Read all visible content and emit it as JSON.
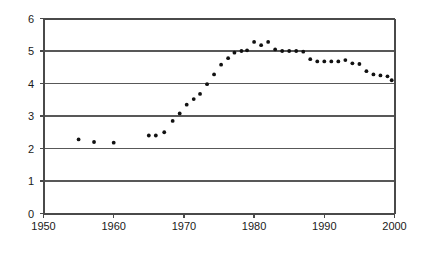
{
  "chart_data": {
    "type": "scatter",
    "title": "",
    "xlabel": "",
    "ylabel": "",
    "xlim": [
      1950,
      2000
    ],
    "ylim": [
      0,
      6
    ],
    "grid": true,
    "legend": false,
    "xticks": [
      1950,
      1960,
      1970,
      1980,
      1990,
      2000
    ],
    "yticks": [
      0,
      1,
      2,
      3,
      4,
      5,
      6
    ],
    "xtick_labels": [
      "1950",
      "1960",
      "1970",
      "1980",
      "1990",
      "2000"
    ],
    "ytick_labels": [
      "0",
      "1",
      "2",
      "3",
      "4",
      "5",
      "6"
    ],
    "series": [
      {
        "name": "series-1",
        "marker": "dot",
        "color": "#111111",
        "points": [
          [
            1955.0,
            2.28
          ],
          [
            1957.2,
            2.2
          ],
          [
            1960.0,
            2.18
          ],
          [
            1965.0,
            2.4
          ],
          [
            1966.0,
            2.4
          ],
          [
            1967.2,
            2.5
          ],
          [
            1968.4,
            2.85
          ],
          [
            1969.4,
            3.08
          ],
          [
            1970.4,
            3.35
          ],
          [
            1971.4,
            3.52
          ],
          [
            1972.3,
            3.68
          ],
          [
            1973.3,
            3.98
          ],
          [
            1974.3,
            4.28
          ],
          [
            1975.3,
            4.58
          ],
          [
            1976.3,
            4.78
          ],
          [
            1977.2,
            4.95
          ],
          [
            1978.2,
            5.0
          ],
          [
            1979.0,
            5.02
          ],
          [
            1980.0,
            5.28
          ],
          [
            1981.0,
            5.18
          ],
          [
            1982.0,
            5.28
          ],
          [
            1983.0,
            5.05
          ],
          [
            1984.0,
            5.0
          ],
          [
            1985.0,
            5.0
          ],
          [
            1986.0,
            5.0
          ],
          [
            1987.0,
            4.98
          ],
          [
            1988.0,
            4.75
          ],
          [
            1989.0,
            4.68
          ],
          [
            1990.0,
            4.68
          ],
          [
            1991.0,
            4.68
          ],
          [
            1992.0,
            4.68
          ],
          [
            1993.0,
            4.72
          ],
          [
            1994.0,
            4.62
          ],
          [
            1995.0,
            4.6
          ],
          [
            1996.0,
            4.38
          ],
          [
            1997.0,
            4.28
          ],
          [
            1998.0,
            4.25
          ],
          [
            1999.0,
            4.22
          ],
          [
            1999.6,
            4.1
          ]
        ]
      }
    ]
  }
}
